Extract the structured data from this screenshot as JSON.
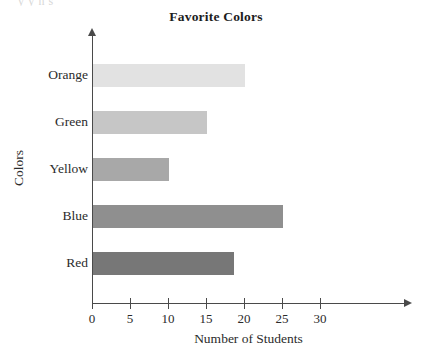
{
  "page": {
    "bleed_text": "y                                              y   n              s"
  },
  "chart_data": {
    "type": "bar",
    "orientation": "horizontal",
    "title": "Favorite Colors",
    "xlabel": "Number of Students",
    "ylabel": "Colors",
    "categories": [
      "Red",
      "Blue",
      "Yellow",
      "Green",
      "Orange"
    ],
    "values": [
      18.5,
      25,
      10,
      15,
      20
    ],
    "bar_colors": [
      "#777777",
      "#8f8f8f",
      "#a8a8a8",
      "#c6c6c6",
      "#e2e2e2"
    ],
    "xlim": [
      0,
      33
    ],
    "xticks": [
      0,
      5,
      10,
      15,
      20,
      25,
      30
    ],
    "xtick_labels": [
      "0",
      "5",
      "10",
      "15",
      "20",
      "25",
      "30"
    ],
    "grid": false,
    "legend": false,
    "bars": [
      {
        "category": "Orange",
        "value": 20,
        "color": "#e2e2e2"
      },
      {
        "category": "Green",
        "value": 15,
        "color": "#c6c6c6"
      },
      {
        "category": "Yellow",
        "value": 10,
        "color": "#a8a8a8"
      },
      {
        "category": "Blue",
        "value": 25,
        "color": "#8f8f8f"
      },
      {
        "category": "Red",
        "value": 18.5,
        "color": "#777777"
      }
    ]
  }
}
